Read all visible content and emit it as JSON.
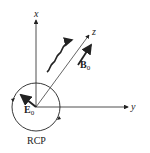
{
  "diagram": {
    "axes": {
      "x_label": "x",
      "y_label": "y",
      "z_label": "z"
    },
    "vectors": {
      "E_label": "E",
      "E_subscript": "0",
      "B_label": "B",
      "B_subscript": "0"
    },
    "polarization_label": "RCP",
    "colors": {
      "ink": "#222222",
      "background": "#ffffff"
    }
  }
}
